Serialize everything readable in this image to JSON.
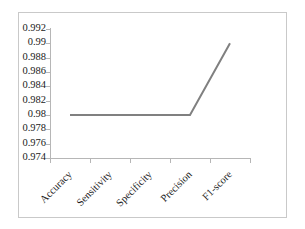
{
  "chart_data": {
    "type": "line",
    "title": "",
    "xlabel": "",
    "ylabel": "",
    "categories": [
      "Accuracy",
      "Sensitivity",
      "Specificity",
      "Precision",
      "F1-score"
    ],
    "values": [
      0.98,
      0.98,
      0.98,
      0.98,
      0.99
    ],
    "series": [
      {
        "name": "",
        "values": [
          0.98,
          0.98,
          0.98,
          0.98,
          0.99
        ],
        "color": "#808080"
      }
    ],
    "ylim": [
      0.974,
      0.992
    ],
    "ytick_step": 0.002,
    "yticks": [
      0.992,
      0.99,
      0.988,
      0.986,
      0.984,
      0.982,
      0.98,
      0.978,
      0.976,
      0.974
    ],
    "ytick_labels": [
      "0.992",
      "0.99",
      "0.988",
      "0.986",
      "0.984",
      "0.982",
      "0.98",
      "0.978",
      "0.976",
      "0.974"
    ],
    "grid": false,
    "legend": false,
    "legend_position": "none",
    "xtick_label_rotation": -45,
    "marker": "none",
    "line_color": "#808080",
    "line_width": 2,
    "axis_color": "#b6b6b6",
    "frame_color": "#c9c9c9",
    "background_color": "#ffffff",
    "text_color": "#1a1a1a"
  }
}
